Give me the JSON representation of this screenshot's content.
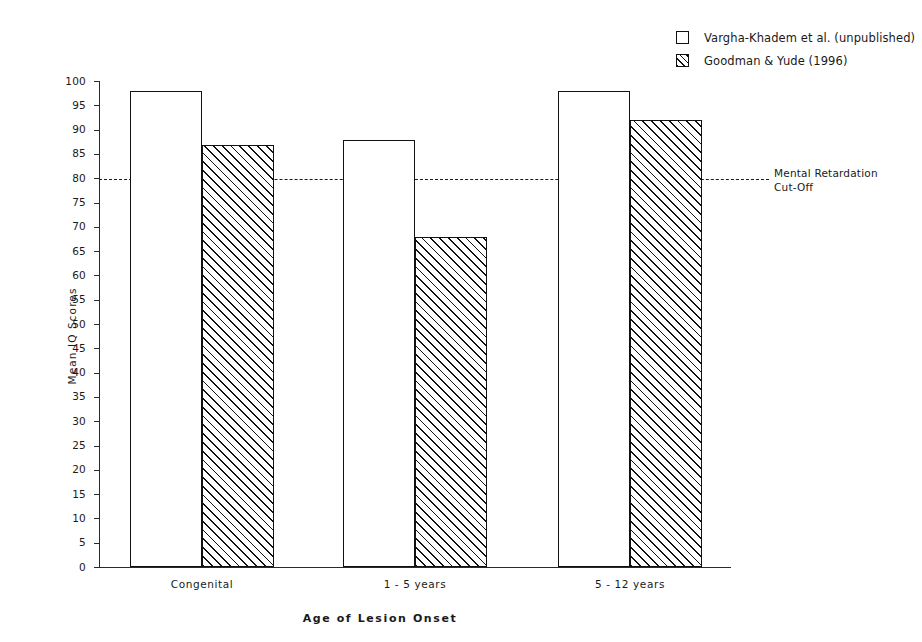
{
  "chart_data": {
    "type": "bar",
    "title": "",
    "xlabel": "Age of Lesion Onset",
    "ylabel": "Mean IQ Scores",
    "categories": [
      "Congenital",
      "1 - 5 years",
      "5 - 12 years"
    ],
    "series": [
      {
        "name": "Vargha-Khadem et al. (unpublished)",
        "values": [
          98,
          88,
          98
        ],
        "style": "open"
      },
      {
        "name": "Goodman & Yude (1996)",
        "values": [
          87,
          68,
          92
        ],
        "style": "hatched"
      }
    ],
    "ylim": [
      0,
      100
    ],
    "ytick_step": 5,
    "yticks": [
      0,
      5,
      10,
      15,
      20,
      25,
      30,
      35,
      40,
      45,
      50,
      55,
      60,
      65,
      70,
      75,
      80,
      85,
      90,
      95,
      100
    ],
    "grid": false,
    "legend_position": "top-right",
    "annotations": [
      {
        "name": "mental-retardation-cutoff",
        "value": 80,
        "line_style": "dashed",
        "label_line1": "Mental Retardation",
        "label_line2": "Cut-Off"
      }
    ],
    "colors": {
      "line": "#111111",
      "background": "#ffffff",
      "text": "#1a1a1a"
    }
  },
  "legend": {
    "items": [
      {
        "label": "Vargha-Khadem et al. (unpublished)",
        "swatch": "open-square-icon"
      },
      {
        "label": "Goodman & Yude (1996)",
        "swatch": "hatched-square-icon"
      }
    ]
  }
}
